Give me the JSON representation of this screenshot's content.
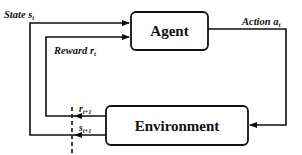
{
  "diagram": {
    "nodes": [
      {
        "id": "agent",
        "label": "Agent"
      },
      {
        "id": "environment",
        "label": "Environment"
      }
    ],
    "edges": [
      {
        "id": "action",
        "from": "agent",
        "to": "environment",
        "label": "Action",
        "symbol": "a",
        "subscript": "t"
      },
      {
        "id": "state",
        "from": "environment",
        "to": "agent",
        "label": "State",
        "symbol": "s",
        "subscript": "t"
      },
      {
        "id": "reward",
        "from": "environment",
        "to": "agent",
        "label": "Reward",
        "symbol": "r",
        "subscript": "t"
      }
    ],
    "env_outputs": {
      "reward_next": {
        "symbol": "r",
        "subscript": "t+1"
      },
      "state_next": {
        "symbol": "s",
        "subscript": "t+1"
      }
    },
    "colors": {
      "stroke": "#111111",
      "background": "#ffffff"
    }
  }
}
